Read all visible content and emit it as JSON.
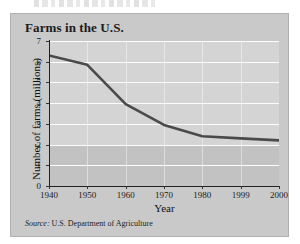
{
  "figure": {
    "title": "Farms in the U.S.",
    "source_word": "Source:",
    "source_text": "U.S. Department of Agriculture"
  },
  "chart_data": {
    "type": "line",
    "title": "Farms in the U.S.",
    "xlabel": "Year",
    "ylabel": "Number of farms (millions)",
    "categories": [
      "1940",
      "1950",
      "1960",
      "1970",
      "1980",
      "1999",
      "2000"
    ],
    "values": [
      6.3,
      5.85,
      3.95,
      2.95,
      2.4,
      2.3,
      2.2
    ],
    "ylim": [
      0,
      7
    ],
    "yticks": [
      "0",
      "1",
      "2",
      "3",
      "4",
      "5",
      "6",
      "7"
    ],
    "grid": "horizontal-and-vertical",
    "legend": "none",
    "line_color": "#4a4a4a",
    "source": "Source: U.S. Department of Agriculture"
  }
}
